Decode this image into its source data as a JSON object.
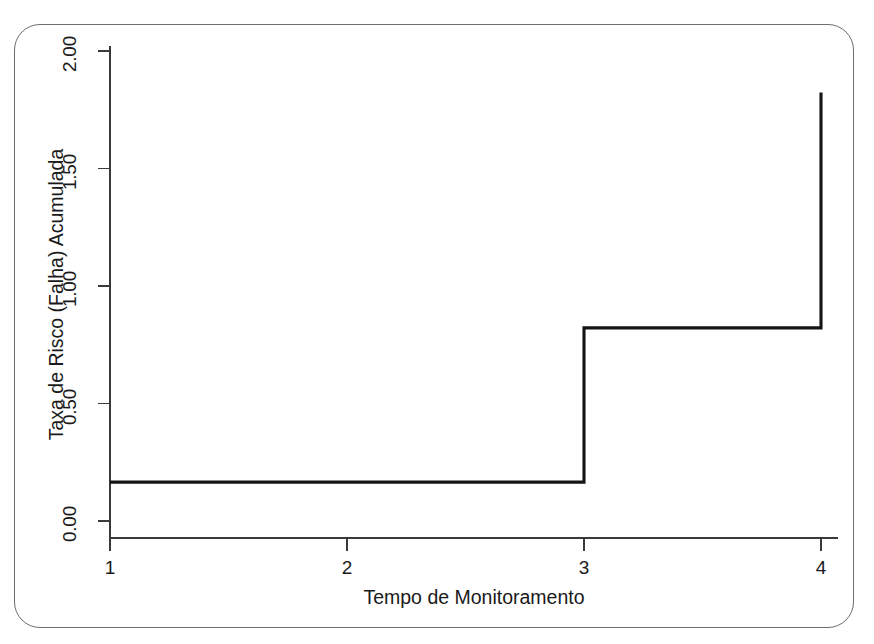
{
  "figure": {
    "background_color": "#ffffff",
    "border_color": "#6d6d6d",
    "line_color": "#141414",
    "axis_color": "#3a3a3a"
  },
  "chart_data": {
    "type": "line",
    "subtype": "step",
    "title": "",
    "subtitle": "",
    "xlabel": "Tempo de Monitoramento",
    "ylabel": "Taxa de Risco (Falha) Acumulada",
    "xlim": [
      1,
      4
    ],
    "ylim": [
      0,
      2.05
    ],
    "xticks": [
      1,
      2,
      3,
      4
    ],
    "xtick_labels": [
      "1",
      "2",
      "3",
      "4"
    ],
    "yticks": [
      0,
      0.5,
      1.0,
      1.5,
      2.0
    ],
    "ytick_labels": [
      "0.00",
      "0.50",
      "1.00",
      "1.50",
      "2.00"
    ],
    "grid": false,
    "legend": false,
    "legend_position": "none",
    "step_where": "post",
    "x": [
      1,
      3,
      3,
      4,
      4
    ],
    "y": [
      0.165,
      0.165,
      0.82,
      0.82,
      1.82
    ],
    "series": [
      {
        "name": "Taxa de Risco (Falha) Acumulada",
        "x": [
          1,
          3,
          4
        ],
        "values": [
          0.165,
          0.82,
          1.82
        ]
      }
    ],
    "annotations": []
  }
}
